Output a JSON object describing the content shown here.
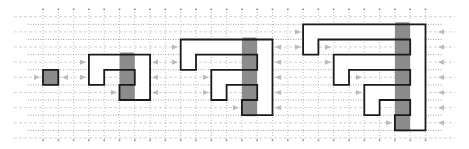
{
  "diagram": {
    "title": "",
    "colors": {
      "background": "#ffffff",
      "outline": "#1a1a1a",
      "shaded_column": "#8c8c8c",
      "arrow": "#bcbcbc",
      "grid": "#9a9a9a"
    },
    "stages": [
      {
        "id": 1,
        "label": "",
        "size_cells": "1x1"
      },
      {
        "id": 2,
        "label": "",
        "size_cells": "4x3"
      },
      {
        "id": 3,
        "label": "",
        "size_cells": "6x5"
      },
      {
        "id": 4,
        "label": "",
        "size_cells": "8x7"
      }
    ]
  }
}
